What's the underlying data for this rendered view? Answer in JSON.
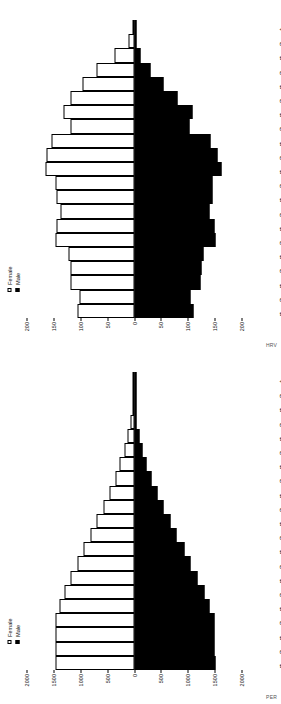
{
  "figure": {
    "type": "population-pyramid-grid",
    "orientation": "rotated-90-clockwise",
    "legend": {
      "female_label": "Female",
      "male_label": "Male"
    },
    "axis_title": "Total population (000s) – estimates",
    "colors": {
      "female": "#ffffff",
      "male": "#000000",
      "axis": "#000000",
      "text": "#111111"
    }
  },
  "panels": [
    {
      "code": "HRV",
      "chart_ref": 0
    },
    {
      "code": "PER",
      "chart_ref": 1
    }
  ],
  "chart_data": [
    {
      "type": "bar",
      "subtype": "population-pyramid",
      "title": "HRV",
      "xlabel": "",
      "ylabel": "Total population (000s) – estimates",
      "axis_title": "Total population (000s) – estimates",
      "panel_code": "HRV",
      "grid": false,
      "legend_position": "top-left",
      "categories": [
        "0–4",
        "5–9",
        "10–14",
        "15–19",
        "20–24",
        "25–29",
        "30–34",
        "35–39",
        "40–44",
        "45–49",
        "50–54",
        "55–59",
        "60–64",
        "65–69",
        "70–74",
        "75–79",
        "80–84",
        "85–89",
        "90–94",
        "95–99",
        "100+"
      ],
      "tick_labels": [
        "200",
        "150",
        "100",
        "50",
        "0",
        "50",
        "100",
        "150",
        "200"
      ],
      "ylim": [
        -200,
        200
      ],
      "units": "thousands",
      "series": [
        {
          "name": "Female",
          "values": [
            105,
            101,
            118,
            119,
            122,
            146,
            145,
            137,
            144,
            146,
            165,
            162,
            153,
            118,
            132,
            118,
            95,
            69,
            36,
            10,
            2
          ]
        },
        {
          "name": "Male",
          "values": [
            110,
            106,
            124,
            126,
            129,
            152,
            149,
            140,
            146,
            146,
            162,
            156,
            142,
            103,
            108,
            81,
            55,
            31,
            12,
            3,
            0.4
          ]
        }
      ]
    },
    {
      "type": "bar",
      "subtype": "population-pyramid",
      "title": "PER",
      "xlabel": "",
      "ylabel": "Total population (000s) – estimates",
      "axis_title": "Total population (000s) – estimates",
      "panel_code": "PER",
      "grid": false,
      "legend_position": "top-left",
      "categories": [
        "0–4",
        "5–9",
        "10–14",
        "15–19",
        "20–24",
        "25–29",
        "30–34",
        "35–39",
        "40–44",
        "45–49",
        "50–54",
        "55–59",
        "60–64",
        "65–69",
        "70–74",
        "75–79",
        "80–84",
        "85–89",
        "90–94",
        "95–99",
        "100+"
      ],
      "tick_labels": [
        "2000",
        "1500",
        "1000",
        "500",
        "0",
        "500",
        "1000",
        "1500",
        "2000"
      ],
      "ylim": [
        -2000,
        2000
      ],
      "units": "thousands",
      "series": [
        {
          "name": "Female",
          "values": [
            1465,
            1465,
            1465,
            1455,
            1385,
            1290,
            1180,
            1060,
            945,
            810,
            690,
            565,
            455,
            350,
            262,
            185,
            120,
            66,
            28,
            8,
            2
          ]
        },
        {
          "name": "Male",
          "values": [
            1510,
            1505,
            1505,
            1490,
            1410,
            1305,
            1185,
            1055,
            935,
            795,
            672,
            545,
            430,
            325,
            238,
            162,
            100,
            52,
            20,
            5,
            1
          ]
        }
      ]
    }
  ]
}
